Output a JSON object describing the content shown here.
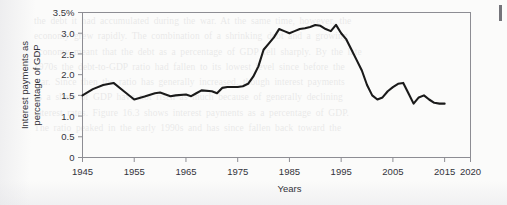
{
  "figure": {
    "kind": "scanned-textbook-figure",
    "background_color": "#fbfbfa",
    "line_color": "#1a1a1a",
    "axis_color": "#8d8d93",
    "text_color": "#33333a",
    "edge_artifact_color": "#5c5c63"
  },
  "ghost": {
    "line1": "the debt it had accumulated during the war. At the same time, however, the",
    "line2": "economy grew rapidly. The combination of a shrinking debt and a growing",
    "line3": "economy meant that the debt as a percentage of GDP fell sharply. By the late",
    "line4": "1970s the debt-to-GDP ratio had fallen to its lowest level since before the",
    "line5": "war. Since then the ratio has generally increased, though interest payments",
    "line6": "as a share of GDP have not risen as much because of generally declining",
    "line7": "interest rates. Figure 16.3 shows interest payments as a percentage of GDP.",
    "line8": "The ratio peaked in the early 1990s and has since fallen back toward the"
  },
  "chart_data": {
    "type": "line",
    "title": "",
    "xlabel": "Years",
    "ylabel": "Interest payments as percentage of GDP",
    "ylabel_lines": [
      "Interest payments as",
      "percentage of GDP"
    ],
    "xlim": [
      1945,
      2020
    ],
    "ylim": [
      0,
      3.5
    ],
    "grid": false,
    "legend": "none",
    "xticks": [
      1945,
      1955,
      1965,
      1975,
      1985,
      1995,
      2005,
      2015,
      2020
    ],
    "xtick_labels": [
      "1945",
      "1955",
      "1965",
      "1975",
      "1985",
      "1995",
      "2005",
      "2015",
      "2020"
    ],
    "yticks": [
      0,
      0.5,
      1.0,
      1.5,
      2.0,
      2.5,
      3.0,
      3.5
    ],
    "ytick_labels": [
      "0",
      "0.5",
      "1.0",
      "1.5",
      "2.0",
      "2.5",
      "3.0",
      "3.5%"
    ],
    "series": [
      {
        "name": "Interest payments as percentage of GDP",
        "color": "#1a1a1a",
        "x": [
          1945,
          1947,
          1949,
          1951,
          1953,
          1955,
          1957,
          1959,
          1960,
          1962,
          1963,
          1965,
          1966,
          1967,
          1968,
          1970,
          1971,
          1972,
          1973,
          1974,
          1975,
          1976,
          1977,
          1978,
          1979,
          1980,
          1981,
          1982,
          1983,
          1984,
          1985,
          1986,
          1987,
          1988,
          1989,
          1990,
          1991,
          1992,
          1993,
          1994,
          1995,
          1996,
          1997,
          1998,
          1999,
          2000,
          2001,
          2002,
          2003,
          2004,
          2005,
          2006,
          2007,
          2008,
          2009,
          2010,
          2011,
          2012,
          2013,
          2014,
          2015
        ],
        "y": [
          1.5,
          1.65,
          1.75,
          1.8,
          1.6,
          1.4,
          1.47,
          1.55,
          1.57,
          1.48,
          1.5,
          1.52,
          1.48,
          1.55,
          1.62,
          1.6,
          1.55,
          1.68,
          1.7,
          1.7,
          1.7,
          1.72,
          1.78,
          1.95,
          2.2,
          2.6,
          2.75,
          2.9,
          3.1,
          3.05,
          3.0,
          3.05,
          3.1,
          3.12,
          3.15,
          3.2,
          3.18,
          3.1,
          3.05,
          3.2,
          3.0,
          2.85,
          2.6,
          2.35,
          2.1,
          1.75,
          1.5,
          1.4,
          1.45,
          1.6,
          1.7,
          1.78,
          1.8,
          1.55,
          1.3,
          1.45,
          1.5,
          1.4,
          1.32,
          1.3,
          1.3
        ]
      }
    ]
  }
}
